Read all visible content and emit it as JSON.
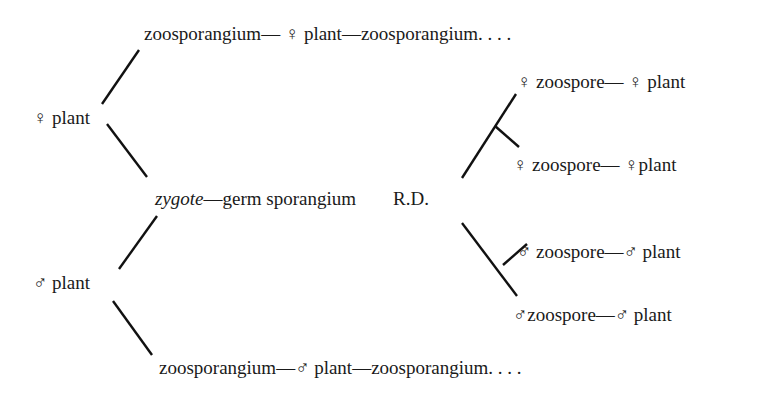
{
  "diagram": {
    "type": "life-cycle-branching-diagram",
    "female_plant": {
      "label": "♀ plant",
      "upper_branch": "zoosporangium— ♀ plant—zoosporangium. . . ."
    },
    "male_plant": {
      "label": "♂ plant",
      "lower_branch": "zoosporangium—♂ plant—zoosporangium. . . ."
    },
    "center": {
      "zygote": "zygote",
      "rest": "—germ sporangium",
      "rd": "R.D."
    },
    "products": [
      {
        "label": "♀ zoospore— ♀ plant"
      },
      {
        "label": "♀ zoospore— ♀plant"
      },
      {
        "label": "♂  zoospore—♂ plant"
      },
      {
        "label": "♂zoospore—♂ plant"
      }
    ]
  }
}
